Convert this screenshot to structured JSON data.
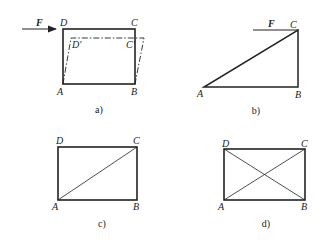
{
  "figures": [
    {
      "id": "a",
      "caption": "a)",
      "force_label": "F",
      "vertices": {
        "A": "A",
        "B": "B",
        "C": "C",
        "D": "D",
        "C_prime": "C'",
        "D_prime": "D'"
      },
      "description": "Rectangle ABCD with horizontal force F applied at D; dashed deformed shape with displaced corners D' and C'"
    },
    {
      "id": "b",
      "caption": "b)",
      "force_label": "F",
      "vertices": {
        "A": "A",
        "B": "B",
        "C": "C"
      },
      "description": "Right triangle ABC with force F applied horizontally at C"
    },
    {
      "id": "c",
      "caption": "c)",
      "vertices": {
        "A": "A",
        "B": "B",
        "C": "C",
        "D": "D"
      },
      "description": "Rectangle ABCD with one diagonal AC"
    },
    {
      "id": "d",
      "caption": "d)",
      "vertices": {
        "A": "A",
        "B": "B",
        "C": "C",
        "D": "D"
      },
      "description": "Rectangle ABCD with both diagonals AC and BD"
    }
  ],
  "colors": {
    "stroke": "#222222",
    "background": "#ffffff"
  }
}
